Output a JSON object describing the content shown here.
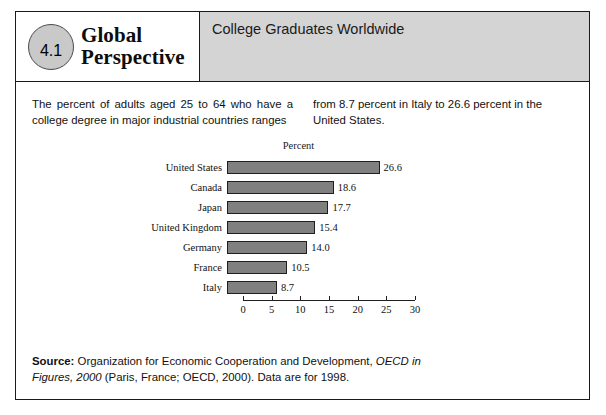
{
  "figure": {
    "badge_number": "4.1",
    "brand_line1": "Global",
    "brand_line2": "Perspective",
    "title": "College Graduates Worldwide"
  },
  "intro": {
    "column_left": "The percent of adults aged 25 to 64 who have a college degree in major industrial countries ranges",
    "column_right": "from 8.7 percent in Italy to 26.6 percent in the United States."
  },
  "chart_data": {
    "type": "bar",
    "orientation": "horizontal",
    "title": "Percent",
    "xlabel": "",
    "ylabel": "",
    "xlim": [
      0,
      30
    ],
    "xticks": [
      0,
      5,
      10,
      15,
      20,
      25,
      30
    ],
    "xtick_labels": [
      "0",
      "5",
      "10",
      "15",
      "20",
      "25",
      "30"
    ],
    "grid": false,
    "legend": false,
    "bar_color": "#808080",
    "bar_edge_color": "#1f1f1f",
    "categories": [
      "United States",
      "Canada",
      "Japan",
      "United Kingdom",
      "Germany",
      "France",
      "Italy"
    ],
    "values": [
      26.6,
      18.6,
      17.7,
      15.4,
      14.0,
      10.5,
      8.7
    ],
    "value_labels": [
      "26.6",
      "18.6",
      "17.7",
      "15.4",
      "14.0",
      "10.5",
      "8.7"
    ]
  },
  "source": {
    "label": "Source:",
    "text_before_italic": " Organization for Economic Cooperation and Development, ",
    "italic_text": "OECD in Figures, 2000",
    "text_after_italic": " (Paris, France; OECD, 2000). Data are for 1998."
  }
}
